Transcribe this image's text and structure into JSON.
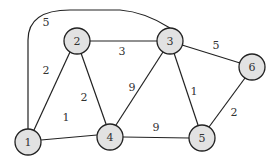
{
  "diagram": {
    "type": "weighted-undirected-graph",
    "colors": {
      "node_fill": "#e2e2e2",
      "stroke": "#222222",
      "text": "#333333"
    },
    "nodes": [
      {
        "id": "1",
        "label": "1",
        "x": 28,
        "y": 142
      },
      {
        "id": "2",
        "label": "2",
        "x": 77,
        "y": 41
      },
      {
        "id": "3",
        "label": "3",
        "x": 170,
        "y": 41
      },
      {
        "id": "4",
        "label": "4",
        "x": 110,
        "y": 137
      },
      {
        "id": "5",
        "label": "5",
        "x": 202,
        "y": 138
      },
      {
        "id": "6",
        "label": "6",
        "x": 252,
        "y": 67
      }
    ],
    "edges": [
      {
        "from": "1",
        "to": "3",
        "weight": "5",
        "curved": true,
        "lx": 46,
        "ly": 22
      },
      {
        "from": "1",
        "to": "2",
        "weight": "2",
        "lx": 46,
        "ly": 70
      },
      {
        "from": "2",
        "to": "3",
        "weight": "3",
        "lx": 122,
        "ly": 51
      },
      {
        "from": "2",
        "to": "4",
        "weight": "2",
        "lx": 84,
        "ly": 97
      },
      {
        "from": "1",
        "to": "4",
        "weight": "1",
        "lx": 66,
        "ly": 117
      },
      {
        "from": "3",
        "to": "4",
        "weight": "9",
        "lx": 132,
        "ly": 87
      },
      {
        "from": "3",
        "to": "5",
        "weight": "1",
        "lx": 194,
        "ly": 91
      },
      {
        "from": "3",
        "to": "6",
        "weight": "5",
        "lx": 216,
        "ly": 45
      },
      {
        "from": "4",
        "to": "5",
        "weight": "9",
        "lx": 156,
        "ly": 127
      },
      {
        "from": "5",
        "to": "6",
        "weight": "2",
        "lx": 234,
        "ly": 112
      }
    ]
  }
}
